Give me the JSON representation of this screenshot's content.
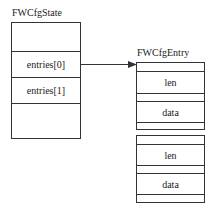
{
  "state": {
    "title": "FWCfgState",
    "fields": [
      "",
      "entries[0]",
      "entries[1]",
      ""
    ]
  },
  "entry": {
    "title": "FWCfgEntry",
    "instances": [
      {
        "fields": [
          "",
          "len",
          "",
          "data",
          ""
        ]
      },
      {
        "fields": [
          "",
          "len",
          "",
          "data",
          ""
        ]
      }
    ]
  },
  "arrow": {
    "from": "entries[0]",
    "to": "FWCfgEntry[0]"
  }
}
